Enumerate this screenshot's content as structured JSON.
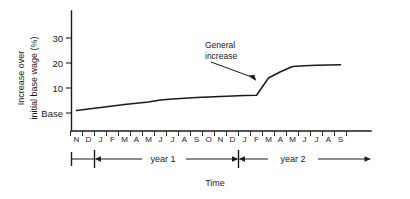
{
  "chart_data": {
    "type": "line",
    "title": "",
    "xlabel": "Time",
    "ylabel": "Increase over initial base wage (%)",
    "ylabel_line1": "Increase over",
    "ylabel_line2": "initial base wage (%)",
    "ylim": [
      0,
      36
    ],
    "yticks": [
      0,
      10,
      20,
      30
    ],
    "ytick_labels": [
      "Base",
      "10",
      "20",
      "30"
    ],
    "grid": false,
    "legend": null,
    "categories": [
      "N",
      "D",
      "J",
      "F",
      "M",
      "A",
      "M",
      "J",
      "J",
      "A",
      "S",
      "O",
      "N",
      "D",
      "J",
      "F",
      "M",
      "A",
      "M",
      "J",
      "J",
      "A",
      "S"
    ],
    "x": [
      1,
      2,
      3,
      4,
      5,
      6,
      7,
      8,
      9,
      10,
      11,
      12,
      13,
      14,
      15,
      16,
      17,
      18,
      19,
      20,
      21,
      22,
      23
    ],
    "values": [
      1.0,
      1.6,
      2.2,
      2.8,
      3.4,
      3.9,
      4.4,
      5.2,
      5.6,
      5.9,
      6.2,
      6.4,
      6.6,
      6.8,
      7.0,
      7.1,
      14.0,
      16.5,
      18.6,
      18.9,
      19.1,
      19.2,
      19.3
    ],
    "annotations": [
      {
        "text": "General increase",
        "line1": "General",
        "line2": "increase",
        "points_to_x": 16.6,
        "points_to_y": 11.5
      }
    ],
    "period_markers": [
      {
        "label": "year 1",
        "start_x": 2,
        "end_x": 14
      },
      {
        "label": "year 2",
        "start_x": 14,
        "end_x": 23
      }
    ],
    "axis_color": "#1a1a1a",
    "line_color": "#1a1a1a"
  }
}
